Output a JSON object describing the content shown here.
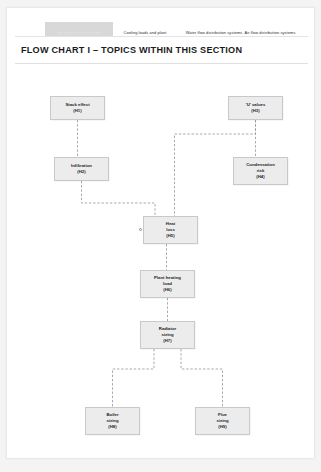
{
  "document": {
    "heading": "FLOW CHART I – TOPICS WITHIN THIS SECTION"
  },
  "tabs": [
    {
      "label": "Heating loads and plant",
      "active": true,
      "left": 38,
      "width": 68
    },
    {
      "label": "Cooling loads and plant",
      "active": false,
      "left": 107,
      "width": 62
    },
    {
      "label": "Water flow distribution systems",
      "active": false,
      "left": 171,
      "width": 72
    },
    {
      "label": "Air flow distribution systems",
      "active": false,
      "left": 228,
      "width": 70
    }
  ],
  "flowchart": {
    "type": "flowchart",
    "nodes": [
      {
        "id": "H1",
        "title": "Stack effect",
        "code": "(H1)",
        "x": 43,
        "y": 88,
        "w": 55,
        "h": 24
      },
      {
        "id": "H3",
        "title": "'U' values",
        "code": "(H3)",
        "x": 221,
        "y": 88,
        "w": 55,
        "h": 24
      },
      {
        "id": "H2",
        "title": "Infiltration",
        "code": "(H2)",
        "x": 47,
        "y": 149,
        "w": 55,
        "h": 24
      },
      {
        "id": "H4",
        "title": "Condensation",
        "sub": "risk",
        "code": "(H4)",
        "x": 226,
        "y": 149,
        "w": 55,
        "h": 28
      },
      {
        "id": "H5",
        "title": "Heat",
        "sub": "loss",
        "code": "(H5)",
        "x": 136,
        "y": 208,
        "w": 55,
        "h": 28
      },
      {
        "id": "H6",
        "title": "Plant heating",
        "sub": "load",
        "code": "(H6)",
        "x": 133,
        "y": 262,
        "w": 55,
        "h": 28
      },
      {
        "id": "H7",
        "title": "Radiator",
        "sub": "sizing",
        "code": "(H7)",
        "x": 133,
        "y": 313,
        "w": 55,
        "h": 28
      },
      {
        "id": "H8",
        "title": "Boiler",
        "sub": "sizing",
        "code": "(H8)",
        "x": 78,
        "y": 399,
        "w": 55,
        "h": 28
      },
      {
        "id": "H9",
        "title": "Flue",
        "sub": "sizing",
        "code": "(H9)",
        "x": 188,
        "y": 399,
        "w": 55,
        "h": 28
      }
    ],
    "edges": [
      {
        "from": "H1",
        "to": "H2",
        "name": "edge-stack-effect-to-infiltration"
      },
      {
        "from": "H3",
        "to": "H4",
        "name": "edge-u-values-to-condensation-risk"
      },
      {
        "from": "H2",
        "to": "H5",
        "name": "edge-infiltration-to-heat-loss"
      },
      {
        "from": "H3",
        "to": "H5",
        "name": "edge-u-values-to-heat-loss"
      },
      {
        "from": "H5",
        "to": "H6",
        "name": "edge-heat-loss-to-plant-heating-load"
      },
      {
        "from": "H6",
        "to": "H7",
        "name": "edge-plant-heating-load-to-radiator-sizing"
      },
      {
        "from": "H7",
        "to": "H8",
        "name": "edge-radiator-sizing-to-boiler-sizing"
      },
      {
        "from": "H7",
        "to": "H9",
        "name": "edge-radiator-sizing-to-flue-sizing"
      }
    ],
    "line_style": "dashed",
    "line_color": "#9a9a9d",
    "node_fill": "#ececed",
    "node_border": "#c9c9cb"
  }
}
